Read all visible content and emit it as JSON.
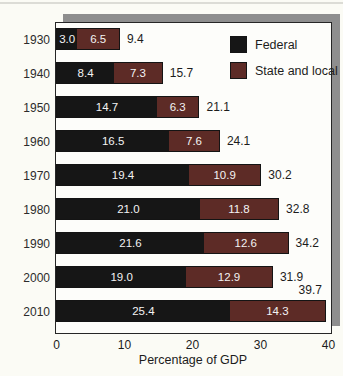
{
  "chart_data": {
    "type": "bar",
    "orientation": "horizontal",
    "stacked": true,
    "title": "",
    "xlabel": "Percentage of GDP",
    "xlim": [
      0,
      40
    ],
    "xticks": [
      0,
      10,
      20,
      30,
      40
    ],
    "grid": false,
    "legend_position": "top-right",
    "categories": [
      "1930",
      "1940",
      "1950",
      "1960",
      "1970",
      "1980",
      "1990",
      "2000",
      "2010"
    ],
    "series": [
      {
        "name": "Federal",
        "color": "#161616",
        "values": [
          3.0,
          8.4,
          14.7,
          16.5,
          19.4,
          21.0,
          21.6,
          19.0,
          25.4
        ]
      },
      {
        "name": "State and local",
        "color": "#5d2b26",
        "values": [
          6.5,
          7.3,
          6.3,
          7.6,
          10.9,
          11.8,
          12.6,
          12.9,
          14.3
        ]
      }
    ],
    "totals": [
      9.4,
      15.7,
      21.1,
      24.1,
      30.2,
      32.8,
      34.2,
      31.9,
      39.7
    ],
    "total_label_above_index": 8
  },
  "colors": {
    "federal": "#161616",
    "state_local": "#5d2b26",
    "panel_background": "#fdfdfa",
    "panel_border": "#262626",
    "shadow": "#8e8e8e",
    "page_background": "#fbfbf5",
    "value_text": "#f3f3f3",
    "label_text": "#1c1c1c"
  },
  "legend": {
    "items": [
      {
        "label": "Federal"
      },
      {
        "label": "State and local"
      }
    ]
  }
}
